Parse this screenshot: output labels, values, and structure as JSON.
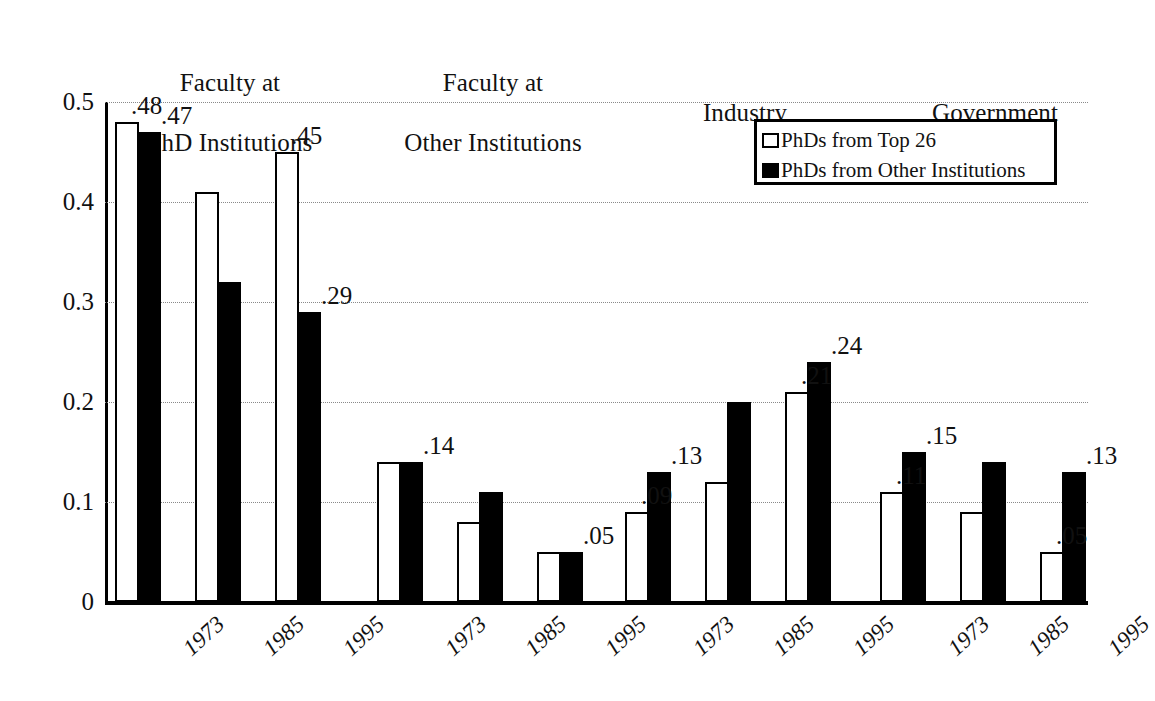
{
  "chart_data": {
    "type": "bar",
    "title": "",
    "subtitle": "",
    "xlabel": "",
    "ylabel": "",
    "ylim": [
      0,
      0.5
    ],
    "ytick_labels": [
      "0",
      "0.1",
      "0.2",
      "0.3",
      "0.4",
      "0.5"
    ],
    "ytick_values": [
      0,
      0.1,
      0.2,
      0.3,
      0.4,
      0.5
    ],
    "grid": "horizontal-dotted",
    "legend_position": "top-right-inside",
    "categories": [
      "1973",
      "1985",
      "1995"
    ],
    "series": [
      {
        "name": "PhDs from Top 26",
        "style": "hollow"
      },
      {
        "name": "PhDs from Other Institutions",
        "style": "filled"
      }
    ],
    "groups": [
      {
        "header": "Faculty at\nPhD Institutions",
        "header_line1": "Faculty at",
        "header_line2": "PhD Institutions",
        "bars": [
          {
            "year": "1973",
            "top26": 0.48,
            "other": 0.47,
            "label_top26": ".48",
            "label_other": ".47"
          },
          {
            "year": "1985",
            "top26": 0.41,
            "other": 0.32,
            "label_top26": "",
            "label_other": ""
          },
          {
            "year": "1995",
            "top26": 0.45,
            "other": 0.29,
            "label_top26": ".45",
            "label_other": ".29"
          }
        ]
      },
      {
        "header": "Faculty at\nOther Institutions",
        "header_line1": "Faculty at",
        "header_line2": "Other Institutions",
        "bars": [
          {
            "year": "1973",
            "top26": 0.14,
            "other": 0.14,
            "label_top26": "",
            "label_other": ".14"
          },
          {
            "year": "1985",
            "top26": 0.08,
            "other": 0.11,
            "label_top26": "",
            "label_other": ""
          },
          {
            "year": "1995",
            "top26": 0.05,
            "other": 0.05,
            "label_top26": "",
            "label_other": ".05"
          }
        ]
      },
      {
        "header": "Industry",
        "header_line1": "",
        "header_line2": "Industry",
        "bars": [
          {
            "year": "1973",
            "top26": 0.09,
            "other": 0.13,
            "label_top26": ".09",
            "label_other": ".13"
          },
          {
            "year": "1985",
            "top26": 0.12,
            "other": 0.2,
            "label_top26": "",
            "label_other": ""
          },
          {
            "year": "1995",
            "top26": 0.21,
            "other": 0.24,
            "label_top26": ".21",
            "label_other": ".24"
          }
        ]
      },
      {
        "header": "Government",
        "header_line1": "",
        "header_line2": "Government",
        "bars": [
          {
            "year": "1973",
            "top26": 0.11,
            "other": 0.15,
            "label_top26": ".11",
            "label_other": ".15"
          },
          {
            "year": "1985",
            "top26": 0.09,
            "other": 0.14,
            "label_top26": "",
            "label_other": ""
          },
          {
            "year": "1995",
            "top26": 0.05,
            "other": 0.13,
            "label_top26": ".05",
            "label_other": ".13"
          }
        ]
      }
    ]
  },
  "colors": {
    "series_hollow": "#ffffff",
    "series_filled": "#000000",
    "axis": "#000000",
    "grid": "#8a8a8a",
    "text": "#111111",
    "background": "#ffffff"
  },
  "legend": {
    "items": [
      {
        "label": "PhDs from Top 26",
        "style": "hollow"
      },
      {
        "label": "PhDs from Other Institutions",
        "style": "filled"
      }
    ]
  }
}
